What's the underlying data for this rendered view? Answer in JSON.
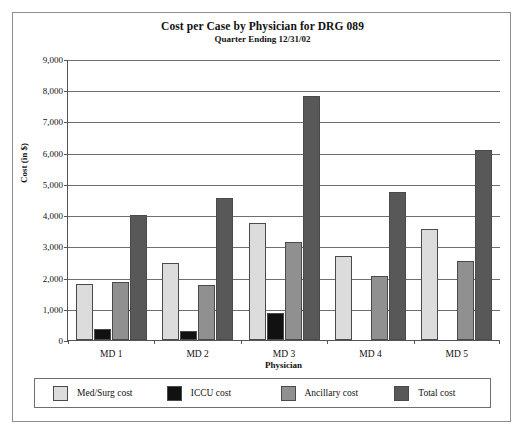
{
  "chart_data": {
    "type": "bar",
    "title": "Cost per Case by Physician for DRG 089",
    "subtitle": "Quarter Ending 12/31/02",
    "xlabel": "Physician",
    "ylabel": "Cost (in $)",
    "categories": [
      "MD 1",
      "MD 2",
      "MD 3",
      "MD 4",
      "MD 5"
    ],
    "series": [
      {
        "name": "Med/Surg cost",
        "color": "#dcdcdc",
        "values": [
          1800,
          2480,
          3750,
          2700,
          3550
        ]
      },
      {
        "name": "ICCU cost",
        "color": "#111111",
        "values": [
          350,
          300,
          850,
          0,
          0
        ]
      },
      {
        "name": "Ancillary cost",
        "color": "#909090",
        "values": [
          1850,
          1750,
          3150,
          2050,
          2530
        ]
      },
      {
        "name": "Total cost",
        "color": "#585858",
        "values": [
          4000,
          4550,
          7800,
          4750,
          6100
        ]
      }
    ],
    "ylim": [
      0,
      9000
    ],
    "yticks": [
      0,
      1000,
      2000,
      3000,
      4000,
      5000,
      6000,
      7000,
      8000,
      9000
    ],
    "ytick_labels": [
      "0",
      "1,000",
      "2,000",
      "3,000",
      "4,000",
      "5,000",
      "6,000",
      "7,000",
      "8,000",
      "9,000"
    ],
    "grid": true,
    "legend_position": "bottom"
  }
}
